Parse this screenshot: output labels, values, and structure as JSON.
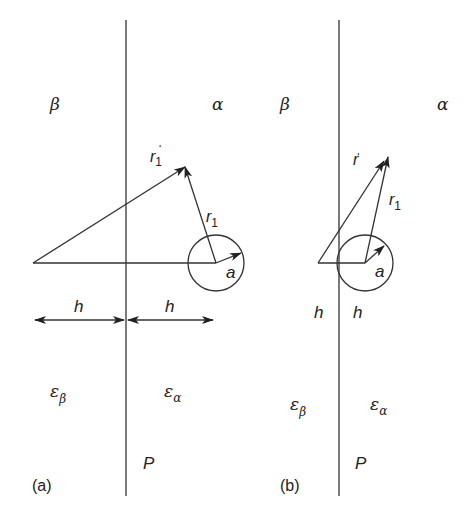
{
  "figure": {
    "panels": [
      {
        "id": "a",
        "caption": "(a)",
        "region_left": "β",
        "region_right": "α",
        "permittivity_left": "ε",
        "permittivity_left_sub": "β",
        "permittivity_right": "ε",
        "permittivity_right_sub": "α",
        "plane_label": "P",
        "vector_image_label": "r",
        "vector_image_sub": "1",
        "vector_image_prime": "'",
        "vector_label": "r",
        "vector_sub": "1",
        "radius_label": "a",
        "distance_left_label": "h",
        "distance_right_label": "h"
      },
      {
        "id": "b",
        "caption": "(b)",
        "region_left": "β",
        "region_right": "α",
        "permittivity_left": "ε",
        "permittivity_left_sub": "β",
        "permittivity_right": "ε",
        "permittivity_right_sub": "α",
        "plane_label": "P",
        "vector_image_label": "r",
        "vector_image_sub": "1",
        "vector_image_prime": "'",
        "vector_label": "r",
        "vector_sub": "1",
        "radius_label": "a",
        "distance_left_label": "h",
        "distance_right_label": "h"
      }
    ]
  }
}
